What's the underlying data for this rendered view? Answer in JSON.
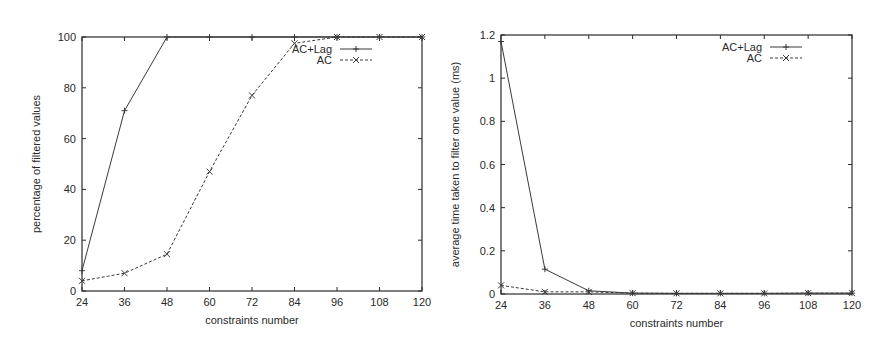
{
  "chart_data": [
    {
      "type": "line",
      "title": "",
      "xlabel": "constraints number",
      "ylabel": "percentage of filtered values",
      "x": [
        24,
        36,
        48,
        60,
        72,
        84,
        96,
        108,
        120
      ],
      "xticks": [
        24,
        36,
        48,
        60,
        72,
        84,
        96,
        108,
        120
      ],
      "yticks": [
        0,
        20,
        40,
        60,
        80,
        100
      ],
      "xlim": [
        24,
        120
      ],
      "ylim": [
        0,
        100
      ],
      "grid": false,
      "legend_position": "top-right",
      "series": [
        {
          "name": "AC+Lag",
          "style": "solid",
          "marker": "+",
          "values": [
            8,
            71,
            100,
            100,
            100,
            100,
            100,
            100,
            100
          ]
        },
        {
          "name": "AC",
          "style": "dashed",
          "marker": "x",
          "values": [
            4,
            7,
            14.5,
            47,
            77,
            97.5,
            100,
            100,
            100
          ]
        }
      ]
    },
    {
      "type": "line",
      "title": "",
      "xlabel": "constraints number",
      "ylabel": "average time taken to filter one value (ms)",
      "x": [
        24,
        36,
        48,
        60,
        72,
        84,
        96,
        108,
        120
      ],
      "xticks": [
        24,
        36,
        48,
        60,
        72,
        84,
        96,
        108,
        120
      ],
      "yticks": [
        0,
        0.2,
        0.4,
        0.6,
        0.8,
        1,
        1.2
      ],
      "ytick_labels": [
        "0",
        "0.2",
        "0.4",
        "0.6",
        "0.8",
        "1",
        "1.2"
      ],
      "xlim": [
        24,
        120
      ],
      "ylim": [
        0,
        1.2
      ],
      "grid": false,
      "legend_position": "top-right",
      "series": [
        {
          "name": "AC+Lag",
          "style": "solid",
          "marker": "+",
          "values": [
            1.17,
            0.115,
            0.015,
            0.004,
            0.003,
            0.003,
            0.003,
            0.004,
            0.004
          ]
        },
        {
          "name": "AC",
          "style": "dashed",
          "marker": "x",
          "values": [
            0.04,
            0.01,
            0.01,
            0.004,
            0.003,
            0.003,
            0.003,
            0.004,
            0.004
          ]
        }
      ]
    }
  ],
  "layout": [
    {
      "left": 82,
      "top": 37,
      "right": 422,
      "bottom": 291
    },
    {
      "left": 501,
      "top": 35,
      "right": 852,
      "bottom": 294
    }
  ],
  "colors": {
    "axis": "#2a2a2a",
    "line": "#3a3a3a",
    "background": "#ffffff"
  }
}
